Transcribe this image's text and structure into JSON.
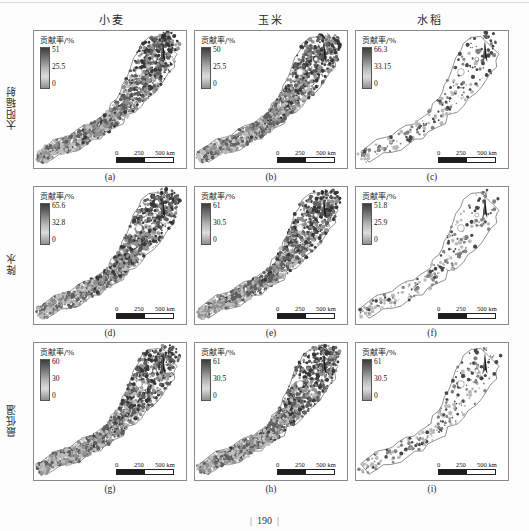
{
  "figure": {
    "page_number": "190",
    "column_headers": [
      "小麦",
      "玉米",
      "水稻"
    ],
    "row_labels": [
      "太阳辐射",
      "降水",
      "最低温"
    ],
    "legend_title": "贡献率/%",
    "scale": {
      "label_0": "0",
      "label_mid": "250",
      "label_max": "500 km"
    },
    "north_label": "N",
    "panels": [
      {
        "caption": "(a)",
        "row": "太阳辐射",
        "column": "小麦",
        "legend_title": "贡献率/%",
        "legend_max": "51",
        "legend_mid": "25.5",
        "legend_min": "0",
        "style": "dense"
      },
      {
        "caption": "(b)",
        "row": "太阳辐射",
        "column": "玉米",
        "legend_title": "贡献率/%",
        "legend_max": "50",
        "legend_mid": "25.5",
        "legend_min": "0",
        "style": "dense"
      },
      {
        "caption": "(c)",
        "row": "太阳辐射",
        "column": "水稻",
        "legend_title": "贡献率/%",
        "legend_max": "66.3",
        "legend_mid": "33.15",
        "legend_min": "0",
        "style": "sparse"
      },
      {
        "caption": "(d)",
        "row": "降水",
        "column": "小麦",
        "legend_title": "贡献率/%",
        "legend_max": "65.6",
        "legend_mid": "32.8",
        "legend_min": "0",
        "style": "dense"
      },
      {
        "caption": "(e)",
        "row": "降水",
        "column": "玉米",
        "legend_title": "贡献率/%",
        "legend_max": "61",
        "legend_mid": "30.5",
        "legend_min": "0",
        "style": "dense"
      },
      {
        "caption": "(f)",
        "row": "降水",
        "column": "水稻",
        "legend_title": "贡献率/%",
        "legend_max": "51.8",
        "legend_mid": "25.9",
        "legend_min": "0",
        "style": "sparse"
      },
      {
        "caption": "(g)",
        "row": "最低温",
        "column": "小麦",
        "legend_title": "贡献率/%",
        "legend_max": "60",
        "legend_mid": "30",
        "legend_min": "0",
        "style": "dense"
      },
      {
        "caption": "(h)",
        "row": "最低温",
        "column": "玉米",
        "legend_title": "贡献率/%",
        "legend_max": "61",
        "legend_mid": "30.5",
        "legend_min": "0",
        "style": "dense"
      },
      {
        "caption": "(i)",
        "row": "最低温",
        "column": "水稻",
        "legend_title": "贡献率/%",
        "legend_max": "61",
        "legend_mid": "30.5",
        "legend_min": "0",
        "style": "sparse"
      }
    ]
  },
  "colors": {
    "ramp_high": "#3c3c3c",
    "ramp_mid": "#b4b4b4",
    "ramp_low": "#8f8f8f",
    "panel_border": "#8a8a8a",
    "text": "#1a1a1a",
    "page_background": "#fdfdfd"
  }
}
